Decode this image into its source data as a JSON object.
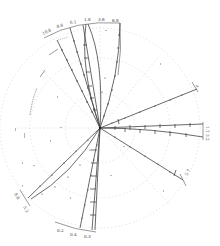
{
  "diagram": {
    "type": "radial-projection",
    "center": [
      100,
      128
    ],
    "colors": {
      "line": "#444444",
      "faint": "#bbbbbb",
      "background": "#ffffff"
    },
    "top_arc_labels": [
      "10.8",
      "8.8",
      "6.1",
      "1.8",
      "3.6",
      "6.8"
    ],
    "bottom_arc_labels": [
      "0.2",
      "0.4",
      "0.3"
    ],
    "right_labels": [
      "4",
      "1.7",
      "3.2",
      "5.7"
    ],
    "left_labels": [
      "9.8",
      "5.2"
    ],
    "rays": [
      {
        "id": "top-1",
        "end": [
          57,
          40
        ],
        "curved": false
      },
      {
        "id": "top-2",
        "end": [
          70,
          28
        ],
        "curved": false
      },
      {
        "id": "top-3",
        "end": [
          83,
          25
        ],
        "curved": false
      },
      {
        "id": "top-4",
        "end": [
          86,
          24
        ],
        "curved": true
      },
      {
        "id": "top-5",
        "end": [
          120,
          22
        ],
        "curved": true
      },
      {
        "id": "right-1",
        "end": [
          197,
          89
        ],
        "curved": false
      },
      {
        "id": "right-2",
        "end": [
          203,
          124
        ],
        "curved": false
      },
      {
        "id": "right-3",
        "end": [
          203,
          137
        ],
        "curved": true
      },
      {
        "id": "right-4",
        "end": [
          183,
          180
        ],
        "curved": false
      },
      {
        "id": "left-1",
        "end": [
          28,
          198
        ],
        "curved": false
      },
      {
        "id": "left-2",
        "end": [
          31,
          199
        ],
        "curved": true
      },
      {
        "id": "bottom-1",
        "end": [
          80,
          228
        ],
        "curved": false
      },
      {
        "id": "bottom-2",
        "end": [
          92,
          230
        ],
        "curved": false
      },
      {
        "id": "bottom-3",
        "end": [
          95,
          230
        ],
        "curved": false
      }
    ]
  }
}
